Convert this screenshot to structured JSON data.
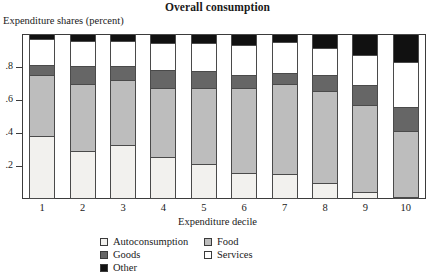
{
  "chart_data": {
    "type": "bar",
    "stacked": true,
    "title": "Overall consumption",
    "ylabel": "Expenditure shares (percent)",
    "xlabel": "Expenditure decile",
    "categories": [
      "1",
      "2",
      "3",
      "4",
      "5",
      "6",
      "7",
      "8",
      "9",
      "10"
    ],
    "ylim": [
      0,
      1
    ],
    "yticks": [
      0.2,
      0.4,
      0.6,
      0.8
    ],
    "ytick_labels": [
      ".2",
      ".4",
      ".6",
      ".8"
    ],
    "grid": false,
    "legend_position": "bottom",
    "series": [
      {
        "name": "Autoconsumption",
        "color": "#f2f1ee",
        "values": [
          0.38,
          0.29,
          0.325,
          0.255,
          0.215,
          0.155,
          0.15,
          0.1,
          0.045,
          0.015
        ]
      },
      {
        "name": "Food",
        "color": "#bdbdbd",
        "values": [
          0.37,
          0.41,
          0.395,
          0.415,
          0.455,
          0.52,
          0.545,
          0.555,
          0.525,
          0.395
        ]
      },
      {
        "name": "Goods",
        "color": "#666666",
        "values": [
          0.065,
          0.105,
          0.085,
          0.11,
          0.105,
          0.075,
          0.07,
          0.095,
          0.12,
          0.145
        ]
      },
      {
        "name": "Services",
        "color": "#ffffff",
        "values": [
          0.155,
          0.155,
          0.155,
          0.165,
          0.17,
          0.185,
          0.185,
          0.165,
          0.18,
          0.275
        ]
      },
      {
        "name": "Other",
        "color": "#111111",
        "values": [
          0.03,
          0.04,
          0.04,
          0.055,
          0.055,
          0.065,
          0.05,
          0.085,
          0.13,
          0.17
        ]
      }
    ]
  },
  "legend": {
    "items": [
      {
        "label": "Autoconsumption",
        "color": "#f2f1ee"
      },
      {
        "label": "Food",
        "color": "#bdbdbd"
      },
      {
        "label": "Goods",
        "color": "#666666"
      },
      {
        "label": "Services",
        "color": "#ffffff"
      },
      {
        "label": "Other",
        "color": "#111111"
      }
    ]
  }
}
